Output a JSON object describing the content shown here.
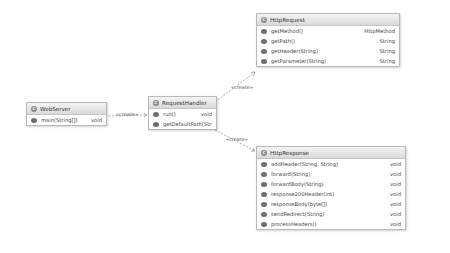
{
  "classes": {
    "webserver": {
      "name": "WebServer",
      "methods": [
        {
          "name": "main(String[])",
          "type": "void"
        }
      ]
    },
    "requesthandler": {
      "name": "RequestHandler",
      "methods": [
        {
          "name": "run()",
          "type": "void"
        },
        {
          "name": "getDefaultPath(Str",
          "type": ""
        }
      ]
    },
    "httprequest": {
      "name": "HttpRequest",
      "methods": [
        {
          "name": "getMethod()",
          "type": "HttpMethod"
        },
        {
          "name": "getPath()",
          "type": "String"
        },
        {
          "name": "getHeader(String)",
          "type": "String"
        },
        {
          "name": "getParameter(String)",
          "type": "String"
        }
      ]
    },
    "httpresponse": {
      "name": "HttpResponse",
      "methods": [
        {
          "name": "addHeader(String, String)",
          "type": "void"
        },
        {
          "name": "forward(String)",
          "type": "void"
        },
        {
          "name": "forwardBody(String)",
          "type": "void"
        },
        {
          "name": "response200Header(int)",
          "type": "void"
        },
        {
          "name": "responseBody(byte[])",
          "type": "void"
        },
        {
          "name": "sendRedirect(String)",
          "type": "void"
        },
        {
          "name": "processHeaders()",
          "type": "void"
        }
      ]
    }
  },
  "relations": [
    {
      "from": "WebServer",
      "to": "RequestHandler",
      "label": "«create»"
    },
    {
      "from": "RequestHandler",
      "to": "HttpRequest",
      "label": "«create»"
    },
    {
      "from": "RequestHandler",
      "to": "HttpResponse",
      "label": "«create»"
    }
  ],
  "icons": {
    "class": "class-icon",
    "method": "public-method-icon"
  }
}
